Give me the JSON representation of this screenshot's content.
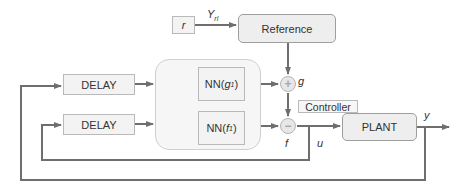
{
  "diagram": {
    "type": "block-diagram",
    "colors": {
      "wire": "#6e6e6e",
      "box_fill": "#f3f3f3",
      "box_border": "#b9b9b9",
      "rounded_fill": "#eeeeee",
      "container_fill": "#f6f6f6",
      "junction_fill": "#e7e7e7",
      "thick_arrow": "#9a9a9a"
    },
    "blocks": {
      "r": {
        "label": "r"
      },
      "reference": {
        "label": "Reference"
      },
      "delay1": {
        "label": "DELAY"
      },
      "delay2": {
        "label": "DELAY"
      },
      "nn_g": {
        "label_main": "NN(",
        "label_var": "g",
        "label_sub": "1",
        "label_close": ")"
      },
      "nn_f": {
        "label_main": "NN(",
        "label_var": "f",
        "label_sub": "1",
        "label_close": ")"
      },
      "controller": {
        "label": "Controller"
      },
      "plant": {
        "label": "PLANT"
      }
    },
    "junctions": {
      "g_junction": {
        "symbol": "+"
      },
      "f_junction": {
        "symbol": "−"
      }
    },
    "signals": {
      "y_rl": {
        "main": "Y",
        "sub": "rl"
      },
      "g": "g",
      "f": "f",
      "u": "u",
      "y": "y"
    },
    "connections": [
      "r -> Reference (Y_rl)",
      "Reference -> g_junction",
      "NN(g1) -> g_junction",
      "g_junction -> f_junction",
      "NN(f1) -> f_junction",
      "f_junction -> PLANT (u)",
      "PLANT -> y (output)",
      "y -> DELAY (top) feedback",
      "u -> DELAY (bottom) feedback",
      "DELAY outputs -> NN block"
    ]
  }
}
